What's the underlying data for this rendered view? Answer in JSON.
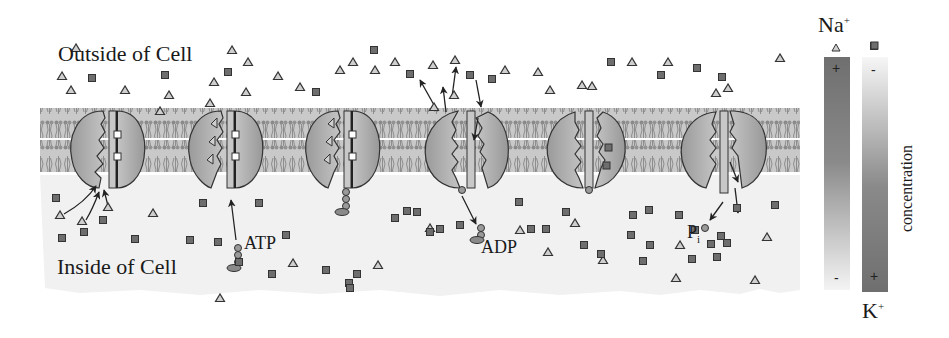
{
  "figure": {
    "labels": {
      "outside": "Outside of Cell",
      "inside": "Inside of Cell",
      "atp": "ATP",
      "adp": "ADP",
      "pi_main": "P",
      "pi_sub": "i"
    },
    "legend": {
      "na_label": "Na",
      "na_charge": "+",
      "na_symbol": "triangle",
      "k_label": "K",
      "k_charge": "+",
      "k_symbol": "square",
      "axis_label": "concentration",
      "na_top_sign": "+",
      "na_bottom_sign": "-",
      "k_top_sign": "-",
      "k_bottom_sign": "+"
    },
    "colors": {
      "membrane": "#b0b0b0",
      "inside_bg": "#f1f1f1",
      "pump_fill": "#a8a8a8",
      "pump_dark": "#7a7a7a",
      "na_fill": "#cfcfcf",
      "k_fill": "#6e6e6e",
      "gradient_dark": "#6f6f6f",
      "gradient_light": "#f4f4f4"
    },
    "stages": [
      {
        "step": 1,
        "description": "3 Na+ bind from inside"
      },
      {
        "step": 2,
        "description": "ATP phosphorylates pump"
      },
      {
        "step": 3,
        "description": "Pump phosphorylated, Na+ bound"
      },
      {
        "step": 4,
        "description": "Pump opens outward, Na+ released, K+ enters; ADP released"
      },
      {
        "step": 5,
        "description": "2 K+ bound"
      },
      {
        "step": 6,
        "description": "Pi released, K+ released inside"
      }
    ],
    "outside_na": [
      [
        76,
        48
      ],
      [
        232,
        50
      ],
      [
        248,
        62
      ],
      [
        62,
        76
      ],
      [
        71,
        90
      ],
      [
        125,
        90
      ],
      [
        169,
        95
      ],
      [
        300,
        87
      ],
      [
        340,
        70
      ],
      [
        353,
        62
      ],
      [
        375,
        70
      ],
      [
        395,
        62
      ],
      [
        278,
        76
      ],
      [
        214,
        82
      ],
      [
        433,
        65
      ],
      [
        455,
        60
      ],
      [
        505,
        70
      ],
      [
        538,
        72
      ],
      [
        550,
        90
      ],
      [
        582,
        85
      ],
      [
        632,
        62
      ],
      [
        668,
        62
      ],
      [
        780,
        58
      ],
      [
        592,
        86
      ],
      [
        716,
        93
      ],
      [
        728,
        88
      ],
      [
        835,
        73
      ],
      [
        210,
        103
      ],
      [
        160,
        111
      ],
      [
        434,
        107
      ],
      [
        454,
        95
      ],
      [
        246,
        92
      ]
    ],
    "outside_k": [
      [
        92,
        78
      ],
      [
        165,
        75
      ],
      [
        228,
        72
      ],
      [
        316,
        92
      ],
      [
        374,
        50
      ],
      [
        410,
        74
      ],
      [
        470,
        75
      ],
      [
        492,
        79
      ],
      [
        611,
        62
      ],
      [
        661,
        75
      ],
      [
        697,
        68
      ],
      [
        722,
        77
      ],
      [
        874,
        46
      ]
    ],
    "inside_na": [
      [
        60,
        215
      ],
      [
        82,
        221
      ],
      [
        108,
        207
      ],
      [
        153,
        213
      ],
      [
        220,
        298
      ],
      [
        293,
        263
      ],
      [
        378,
        265
      ],
      [
        430,
        228
      ],
      [
        520,
        230
      ],
      [
        548,
        252
      ],
      [
        575,
        223
      ],
      [
        603,
        260
      ],
      [
        676,
        278
      ],
      [
        755,
        280
      ],
      [
        680,
        245
      ],
      [
        767,
        237
      ]
    ],
    "inside_k": [
      [
        56,
        198
      ],
      [
        62,
        238
      ],
      [
        84,
        232
      ],
      [
        103,
        220
      ],
      [
        135,
        239
      ],
      [
        190,
        240
      ],
      [
        203,
        203
      ],
      [
        218,
        242
      ],
      [
        239,
        262
      ],
      [
        259,
        203
      ],
      [
        286,
        235
      ],
      [
        272,
        274
      ],
      [
        326,
        270
      ],
      [
        349,
        283
      ],
      [
        357,
        274
      ],
      [
        350,
        288
      ],
      [
        395,
        218
      ],
      [
        407,
        211
      ],
      [
        417,
        212
      ],
      [
        430,
        232
      ],
      [
        440,
        229
      ],
      [
        460,
        225
      ],
      [
        519,
        202
      ],
      [
        531,
        229
      ],
      [
        546,
        229
      ],
      [
        566,
        212
      ],
      [
        584,
        245
      ],
      [
        601,
        254
      ],
      [
        633,
        215
      ],
      [
        649,
        210
      ],
      [
        679,
        215
      ],
      [
        695,
        230
      ],
      [
        721,
        236
      ],
      [
        711,
        244
      ],
      [
        737,
        208
      ],
      [
        775,
        205
      ],
      [
        631,
        235
      ],
      [
        650,
        245
      ],
      [
        643,
        261
      ],
      [
        692,
        259
      ],
      [
        717,
        257
      ],
      [
        727,
        243
      ]
    ]
  }
}
